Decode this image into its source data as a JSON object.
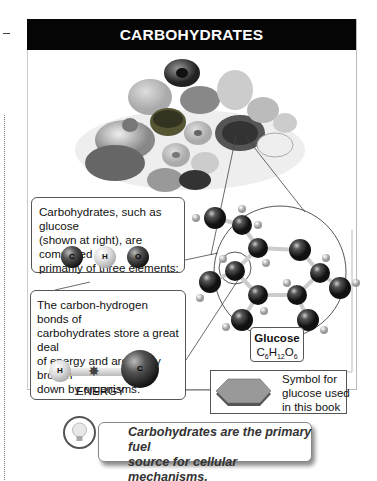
{
  "header": {
    "title": "CARBOHYDRATES"
  },
  "box1": {
    "lines": [
      "Carbohydrates, such as glucose",
      "(shown at right), are composed",
      "primarily of three elements:"
    ],
    "atoms": [
      "C",
      "H",
      "O"
    ]
  },
  "box2": {
    "lines": [
      "The carbon-hydrogen bonds of",
      "carbohydrates store a great deal",
      "of energy and are easily broken",
      "down by organisms."
    ],
    "atom_left": "H",
    "atom_right": "C",
    "energy_label": "ENERGY"
  },
  "glucose": {
    "name": "Glucose",
    "formula_parts": [
      "C",
      "6",
      "H",
      "12",
      "O",
      "6"
    ]
  },
  "symbol_box": {
    "lines": [
      "Symbol for",
      "glucose used",
      "in this book"
    ]
  },
  "callout": {
    "icon": "lightbulb-icon",
    "lines": [
      "Carbohydrates are the primary fuel",
      "source for cellular mechanisms."
    ]
  },
  "colors": {
    "header_bg": "#050505",
    "header_text": "#ffffff",
    "border": "#555555"
  }
}
